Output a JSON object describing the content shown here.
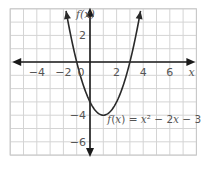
{
  "chart_data": {
    "type": "line",
    "title": "",
    "xlabel": "x",
    "ylabel": "f(x)",
    "xlim": [
      -6,
      8
    ],
    "ylim": [
      -7,
      4
    ],
    "grid": true,
    "grid_step": 1,
    "x_ticks": [
      -4,
      -2,
      0,
      2,
      4,
      6
    ],
    "x_tick_labels": [
      "−4",
      "−2",
      "0",
      "2",
      "4",
      "6"
    ],
    "y_ticks": [
      2,
      -4,
      -6
    ],
    "y_tick_labels": [
      "2",
      "−4",
      "−6"
    ],
    "series": [
      {
        "name": "f(x) = x² − 2x − 3",
        "function": "x^2 - 2x - 3",
        "coefficients": {
          "a": 1,
          "b": -2,
          "c": -3
        },
        "vertex": [
          1,
          -4
        ],
        "roots": [
          -1,
          3
        ],
        "x_range": [
          -1.8,
          3.8
        ],
        "color": "#2a2a2a"
      }
    ],
    "annotations": [
      {
        "text_parts": [
          "f",
          "(",
          "x",
          ") = ",
          "x",
          "² − 2",
          "x",
          " − 3"
        ],
        "anchor_data": [
          1.3,
          -4.6
        ]
      }
    ],
    "colors": {
      "grid": "#d4d4d4",
      "axis": "#1a1a1a",
      "curve": "#2a2a2a",
      "text": "#555555"
    }
  }
}
